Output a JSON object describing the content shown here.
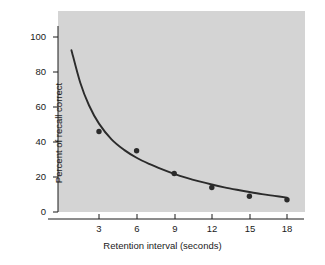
{
  "chart_data": {
    "type": "scatter",
    "title": "",
    "xlabel": "Retention interval (seconds)",
    "ylabel": "Percent of recall correct",
    "xlim": [
      0,
      19.5
    ],
    "ylim": [
      0,
      108
    ],
    "xticks": [
      3,
      6,
      9,
      12,
      15,
      18
    ],
    "xtick_labels": [
      "3",
      "6",
      "9",
      "12",
      "15",
      "18"
    ],
    "yticks": [
      0,
      20,
      40,
      60,
      80,
      100
    ],
    "ytick_labels": [
      "0",
      "20",
      "40",
      "60",
      "80",
      "100"
    ],
    "grid": false,
    "legend": null,
    "x": [
      3,
      6,
      9,
      12,
      15,
      18
    ],
    "values": [
      46,
      35,
      22,
      14,
      9,
      7
    ],
    "series": [
      {
        "name": "Percent of recall correct",
        "x": [
          3,
          6,
          9,
          12,
          15,
          18
        ],
        "values": [
          46,
          35,
          22,
          14,
          9,
          7
        ],
        "marker": "filled-circle",
        "color": "#2b2b2b"
      },
      {
        "name": "Fitted forgetting curve",
        "type": "line",
        "x": [
          0.8,
          1.5,
          2.2,
          3.0,
          4.0,
          5.0,
          6.0,
          7.0,
          8.0,
          9.0,
          10.0,
          11.0,
          12.0,
          13.0,
          14.0,
          15.0,
          16.0,
          17.0,
          18.0
        ],
        "values": [
          92.5,
          74.0,
          61.0,
          50.5,
          41.5,
          35.5,
          31.0,
          27.5,
          24.5,
          21.8,
          19.5,
          17.5,
          15.7,
          14.1,
          12.7,
          11.4,
          10.2,
          9.2,
          8.2
        ],
        "color": "#2b2b2b"
      }
    ],
    "plot_background_color": "#d4d4d4",
    "figure_background_color": "#ffffff",
    "axis_color": "#1a1a1a"
  }
}
